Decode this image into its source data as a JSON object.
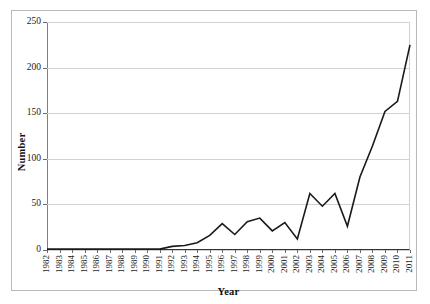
{
  "chart_data": {
    "type": "line",
    "title": "",
    "xlabel": "Year",
    "ylabel": "Number",
    "xlim": [
      1982,
      2011
    ],
    "ylim": [
      0,
      250
    ],
    "yticks": [
      0,
      50,
      100,
      150,
      200,
      250
    ],
    "grid": true,
    "legend": "none",
    "line_color": "#1a1a1a",
    "categories": [
      "1982",
      "1983",
      "1984",
      "1985",
      "1986",
      "1987",
      "1988",
      "1989",
      "1990",
      "1991",
      "1992",
      "1993",
      "1994",
      "1995",
      "1996",
      "1997",
      "1998",
      "1999",
      "2000",
      "2001",
      "2002",
      "2003",
      "2004",
      "2005",
      "2006",
      "2007",
      "2008",
      "2009",
      "2010",
      "2011"
    ],
    "values": [
      1,
      1,
      1,
      1,
      1,
      1,
      1,
      1,
      1,
      1,
      4,
      5,
      8,
      16,
      29,
      17,
      31,
      35,
      21,
      30,
      12,
      62,
      48,
      62,
      26,
      80,
      114,
      152,
      163,
      225
    ]
  }
}
